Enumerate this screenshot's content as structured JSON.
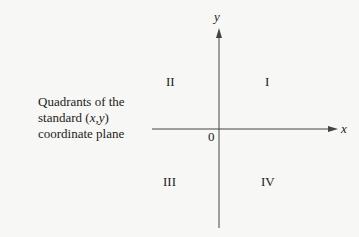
{
  "caption": {
    "line1": "Quadrants of the",
    "line2_prefix": "standard (",
    "line2_vars": "x,y",
    "line2_suffix": ")",
    "line3": "coordinate plane"
  },
  "axes": {
    "x_label": "x",
    "y_label": "y",
    "origin_label": "0"
  },
  "quadrants": {
    "q1": "I",
    "q2": "II",
    "q3": "III",
    "q4": "IV"
  },
  "colors": {
    "axis": "#444444",
    "text": "#222222",
    "background": "#f7f7f5"
  }
}
